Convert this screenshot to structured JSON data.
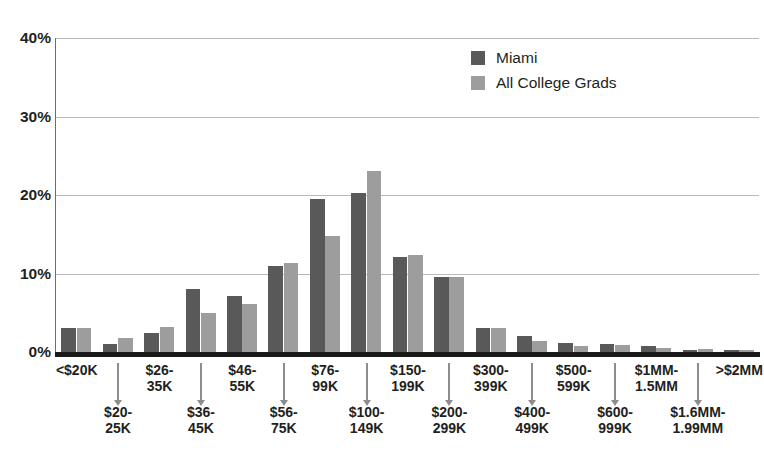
{
  "chart_data": {
    "type": "bar",
    "title": "",
    "subtitle": "",
    "xlabel": "",
    "ylabel": "",
    "ylim": [
      0,
      40
    ],
    "yticks": [
      0,
      10,
      20,
      30,
      40
    ],
    "ytick_labels": [
      "0%",
      "10%",
      "20%",
      "30%",
      "40%"
    ],
    "grid": true,
    "legend_position": "top-right",
    "categories": [
      "<$20K",
      "$20-25K",
      "$26-35K",
      "$36-45K",
      "$46-55K",
      "$56-75K",
      "$76-99K",
      "$100-149K",
      "$150-199K",
      "$200-299K",
      "$300-399K",
      "$400-499K",
      "$500-599K",
      "$600-999K",
      "$1MM-1.5MM",
      "$1.6MM-1.99MM",
      ">$2MM"
    ],
    "category_labels": [
      {
        "text": "<$20K",
        "row": "upper"
      },
      {
        "text": "$20-\n25K",
        "row": "lower"
      },
      {
        "text": "$26-\n35K",
        "row": "upper"
      },
      {
        "text": "$36-\n45K",
        "row": "lower"
      },
      {
        "text": "$46-\n55K",
        "row": "upper"
      },
      {
        "text": "$56-\n75K",
        "row": "lower"
      },
      {
        "text": "$76-\n99K",
        "row": "upper"
      },
      {
        "text": "$100-\n149K",
        "row": "lower"
      },
      {
        "text": "$150-\n199K",
        "row": "upper"
      },
      {
        "text": "$200-\n299K",
        "row": "lower"
      },
      {
        "text": "$300-\n399K",
        "row": "upper"
      },
      {
        "text": "$400-\n499K",
        "row": "lower"
      },
      {
        "text": "$500-\n599K",
        "row": "upper"
      },
      {
        "text": "$600-\n999K",
        "row": "lower"
      },
      {
        "text": "$1MM-\n1.5MM",
        "row": "upper"
      },
      {
        "text": "$1.6MM-\n1.99MM",
        "row": "lower"
      },
      {
        "text": ">$2MM",
        "row": "upper"
      }
    ],
    "series": [
      {
        "name": "Miami",
        "color": "#595959",
        "values": [
          3.0,
          1.0,
          2.4,
          8.0,
          7.1,
          11.0,
          19.5,
          20.2,
          12.1,
          9.6,
          3.0,
          2.0,
          1.2,
          1.0,
          0.8,
          0.3,
          0.2
        ]
      },
      {
        "name": "All College Grads",
        "color": "#9d9d9d",
        "values": [
          3.1,
          1.8,
          3.2,
          5.0,
          6.1,
          11.3,
          14.8,
          23.1,
          12.4,
          9.6,
          3.0,
          1.4,
          0.8,
          0.9,
          0.5,
          0.4,
          0.2
        ]
      }
    ]
  },
  "legend": {
    "items": [
      {
        "label": "Miami",
        "color": "#595959"
      },
      {
        "label": "All College Grads",
        "color": "#9d9d9d"
      }
    ]
  },
  "colors": {
    "miami": "#595959",
    "grads": "#9d9d9d",
    "axis": "#1a1a1a",
    "grid": "#b9b9b9",
    "text": "#231f20",
    "arrow": "#8d8d8d"
  }
}
